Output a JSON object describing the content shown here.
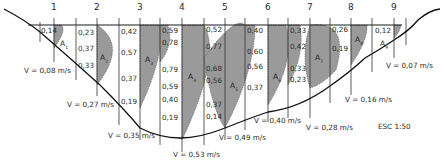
{
  "diagram": {
    "scale_label": "ESC 1:50",
    "colors": {
      "fill": "#9a9a9a",
      "line": "#1a1a1a",
      "text": "#2a2a2a"
    },
    "verticals": [
      {
        "number": "1",
        "depth_values": [
          "0,14"
        ],
        "area": "A",
        "area_sub": "1",
        "velocity": "V = 0,08 m/s"
      },
      {
        "number": "2",
        "depth_values": [
          "0,23",
          "0,37",
          "0,33"
        ],
        "area": "A",
        "area_sub": "2",
        "velocity": "V = 0,27 m/s"
      },
      {
        "number": "3",
        "depth_values": [
          "0,42",
          "0,57",
          "0,37",
          "0,19"
        ],
        "area": "A",
        "area_sub": "3",
        "velocity": "V = 0,35 m/s"
      },
      {
        "number": "4",
        "depth_values": [
          "0,59",
          "0,78",
          "0,79",
          "0,59",
          "0,40",
          "0,19"
        ],
        "area": "A",
        "area_sub": "4",
        "velocity": "V = 0,53 m/s"
      },
      {
        "number": "5",
        "depth_values": [
          "0,52",
          "0,77",
          "0,68",
          "0,56",
          "0,37",
          "0,14"
        ],
        "area": "A",
        "area_sub": "5",
        "velocity": "V = 0,49 m/s"
      },
      {
        "number": "6",
        "depth_values": [
          "0,40",
          "0,60",
          "0,56",
          "0,37"
        ],
        "area": "A",
        "area_sub": "6",
        "velocity": "V = 0,40 m/s"
      },
      {
        "number": "7",
        "depth_values": [
          "0,33",
          "0,42",
          "0,33",
          "0,23"
        ],
        "area": "A",
        "area_sub": "7",
        "velocity": "V = 0,28 m/s"
      },
      {
        "number": "8",
        "depth_values": [
          "0,26",
          "0,19"
        ],
        "area": "A",
        "area_sub": "8",
        "velocity": "V = 0,16 m/s"
      },
      {
        "number": "9",
        "depth_values": [
          "0,12"
        ],
        "area": "A",
        "area_sub": "9",
        "velocity": "V = 0,07 m/s"
      }
    ]
  }
}
